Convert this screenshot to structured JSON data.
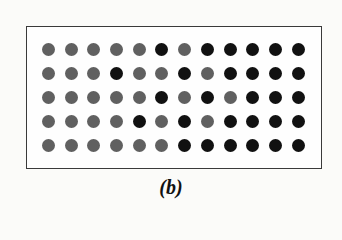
{
  "figure": {
    "caption": "(b)",
    "rows": 5,
    "columns": 12,
    "colors": {
      "G": "#606060",
      "B": "#111111"
    },
    "legend": {
      "G": "gray dot",
      "B": "black dot"
    },
    "grid": [
      [
        "G",
        "G",
        "G",
        "G",
        "G",
        "B",
        "G",
        "B",
        "B",
        "B",
        "B",
        "B"
      ],
      [
        "G",
        "G",
        "G",
        "B",
        "G",
        "G",
        "B",
        "G",
        "B",
        "B",
        "B",
        "B"
      ],
      [
        "G",
        "G",
        "G",
        "G",
        "G",
        "B",
        "G",
        "B",
        "G",
        "B",
        "B",
        "B"
      ],
      [
        "G",
        "G",
        "G",
        "G",
        "B",
        "G",
        "B",
        "G",
        "B",
        "B",
        "B",
        "B"
      ],
      [
        "G",
        "G",
        "G",
        "G",
        "G",
        "G",
        "B",
        "B",
        "B",
        "B",
        "B",
        "B"
      ]
    ]
  }
}
